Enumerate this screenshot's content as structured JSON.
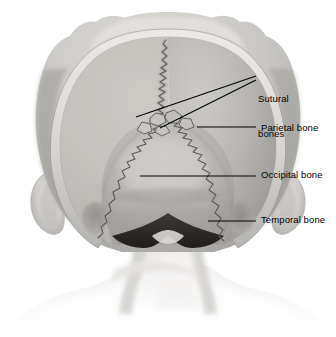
{
  "figure": {
    "view": "posterior",
    "background_color": "#ffffff"
  },
  "labels": [
    {
      "id": "sutural-bones",
      "text": "Sutural\nbones",
      "line1": "Sutural",
      "line2": "bones",
      "multiline": true,
      "leader_count": 2,
      "color": "#000000"
    },
    {
      "id": "parietal-bone",
      "text": "Parietal bone",
      "line1": "Parietal bone",
      "multiline": false,
      "leader_count": 1,
      "color": "#000000"
    },
    {
      "id": "occipital-bone",
      "text": "Occipital bone",
      "line1": "Occipital bone",
      "multiline": false,
      "leader_count": 1,
      "color": "#000000"
    },
    {
      "id": "temporal-bone",
      "text": "Temporal bone",
      "line1": "Temporal bone",
      "multiline": false,
      "leader_count": 1,
      "color": "#000000"
    }
  ],
  "structures": {
    "scalp_rim": "head-outline",
    "parietal_left": "parietal-bone-left",
    "parietal_right": "parietal-bone-right",
    "occipital": "occipital-bone",
    "sagittal_suture": "sagittal-suture",
    "lambdoid_suture": "lambdoid-suture",
    "sutural_bones": "wormian-bones",
    "ear_left": "left-ear",
    "ear_right": "right-ear",
    "neck": "neck",
    "shoulders": "shoulders",
    "foramen": "foramen-magnum-shadow"
  },
  "palette": {
    "skin_light": "#efeeec",
    "skin_mid": "#d9d7d4",
    "bone_light": "#cfcdc9",
    "bone_mid": "#b9b7b3",
    "bone_dark": "#9d9b97",
    "shadow": "#8a8884",
    "suture_line": "#55534f",
    "leader_line": "#000000",
    "foramen_dark": "#2b2a28",
    "white": "#ffffff"
  }
}
